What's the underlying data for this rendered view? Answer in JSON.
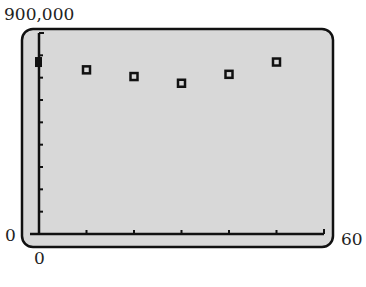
{
  "chart_data": {
    "type": "scatter",
    "title": "",
    "xlabel": "",
    "ylabel": "",
    "xlim": [
      0,
      60
    ],
    "ylim": [
      0,
      900000
    ],
    "x_tick_step": 10,
    "y_tick_step": 100000,
    "grid": false,
    "series": [
      {
        "name": "data",
        "x": [
          0,
          10,
          20,
          30,
          40,
          50
        ],
        "y": [
          770000,
          735000,
          705000,
          675000,
          715000,
          770000
        ]
      }
    ],
    "labels": {
      "ymax": "900,000",
      "ymin": "0",
      "xmin": "0",
      "xmax": "60"
    }
  },
  "colors": {
    "screen_bg": "#d8d8d8",
    "frame": "#111111",
    "marker": "#111111"
  }
}
